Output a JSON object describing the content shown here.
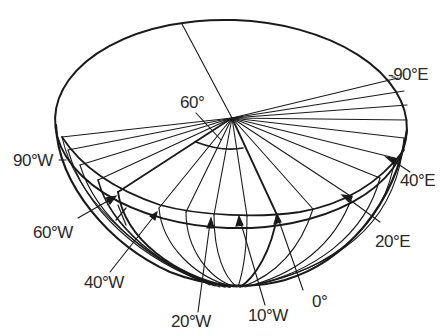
{
  "diagram": {
    "labels": {
      "angle": "60°",
      "east90": "-90°E",
      "west90": "90°W",
      "east40": "40°E",
      "east20": "20°E",
      "west60": "60°W",
      "west40": "40°W",
      "west20": "20°W",
      "west10": "10°W",
      "zero": "0°"
    },
    "colors": {
      "line": "#1a1a1a",
      "background": "#ffffff",
      "text": "#2a2a2a"
    }
  }
}
